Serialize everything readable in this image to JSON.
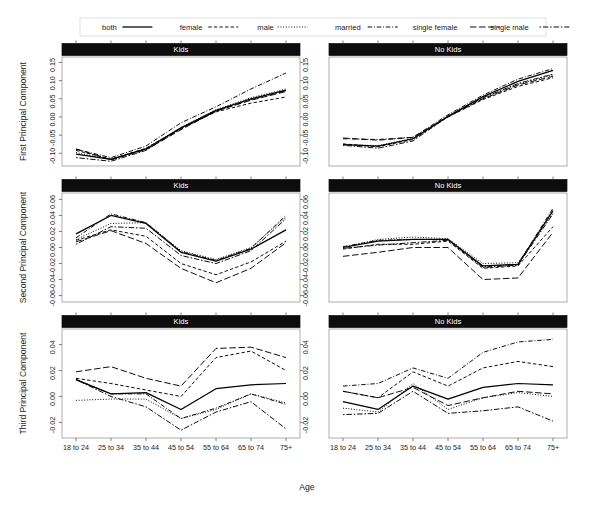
{
  "legend": {
    "position": "top",
    "entries": [
      {
        "label": "both",
        "dash": "none"
      },
      {
        "label": "female",
        "dash": "dashed"
      },
      {
        "label": "male",
        "dash": "dotted"
      },
      {
        "label": "married",
        "dash": "dashdot"
      },
      {
        "label": "single female",
        "dash": "longdash"
      },
      {
        "label": "single male",
        "dash": "twodash"
      }
    ]
  },
  "axes": {
    "xlabel": "Age",
    "categories": [
      "18 to 24",
      "25 to 34",
      "35 to 44",
      "45 to 54",
      "55 to 64",
      "65 to 74",
      "75+"
    ]
  },
  "strips": {
    "kids": "Kids",
    "nokids": "No Kids"
  },
  "rows": [
    {
      "ylabel": "First Principal Component",
      "yticks": [
        -0.1,
        -0.05,
        0.0,
        0.05,
        0.1,
        0.15
      ],
      "yticklabels": [
        "-0.10",
        "-0.05",
        "0.00",
        "0.05",
        "0.10",
        "0.15"
      ],
      "ylim": [
        -0.135,
        0.165
      ]
    },
    {
      "ylabel": "Second Principal Component",
      "yticks": [
        -0.06,
        -0.04,
        -0.02,
        0.0,
        0.02,
        0.04,
        0.06
      ],
      "yticklabels": [
        "-0.06",
        "-0.04",
        "-0.02",
        "0.00",
        "0.02",
        "0.04",
        "0.06"
      ],
      "ylim": [
        -0.068,
        0.068
      ]
    },
    {
      "ylabel": "Third Principal Component",
      "yticks": [
        -0.02,
        0.0,
        0.02,
        0.04
      ],
      "yticklabels": [
        "-0.02",
        "0.00",
        "0.02",
        "0.04"
      ],
      "ylim": [
        -0.032,
        0.052
      ]
    }
  ],
  "chart_data": {
    "type": "line",
    "title": "",
    "xlabel": "Age",
    "ylabel": "Principal Component Score",
    "grid": false,
    "legend_position": "top",
    "x": [
      "18 to 24",
      "25 to 34",
      "35 to 44",
      "45 to 54",
      "55 to 64",
      "65 to 74",
      "75+"
    ],
    "panels": [
      {
        "row": 1,
        "col": 1,
        "strip": "Kids",
        "ylabel": "First Principal Component",
        "ylim": [
          -0.135,
          0.165
        ],
        "yticks": [
          -0.1,
          -0.05,
          0.0,
          0.05,
          0.1,
          0.15
        ],
        "series": [
          {
            "name": "both",
            "dash": "none",
            "values": [
              -0.102,
              -0.117,
              -0.088,
              -0.03,
              0.018,
              0.05,
              0.074
            ]
          },
          {
            "name": "female",
            "dash": "dashed",
            "values": [
              -0.092,
              -0.116,
              -0.086,
              -0.031,
              0.014,
              0.038,
              0.055
            ]
          },
          {
            "name": "male",
            "dash": "dotted",
            "values": [
              -0.098,
              -0.117,
              -0.087,
              -0.029,
              0.02,
              0.053,
              0.077
            ]
          },
          {
            "name": "married",
            "dash": "dashdot",
            "values": [
              -0.089,
              -0.112,
              -0.08,
              -0.016,
              0.028,
              0.077,
              0.121
            ]
          },
          {
            "name": "single female",
            "dash": "longdash",
            "values": [
              -0.088,
              -0.118,
              -0.09,
              -0.035,
              0.016,
              0.046,
              0.07
            ]
          },
          {
            "name": "single male",
            "dash": "twodash",
            "values": [
              -0.112,
              -0.122,
              -0.092,
              -0.033,
              0.016,
              0.048,
              0.072
            ]
          }
        ]
      },
      {
        "row": 1,
        "col": 2,
        "strip": "No Kids",
        "ylabel": "First Principal Component",
        "ylim": [
          -0.135,
          0.165
        ],
        "yticks": [
          -0.1,
          -0.05,
          0.0,
          0.05,
          0.1,
          0.15
        ],
        "series": [
          {
            "name": "both",
            "dash": "none",
            "values": [
              -0.076,
              -0.08,
              -0.06,
              0.002,
              0.056,
              0.098,
              0.128
            ]
          },
          {
            "name": "female",
            "dash": "dashed",
            "values": [
              -0.074,
              -0.082,
              -0.062,
              0.0,
              0.048,
              0.084,
              0.108
            ]
          },
          {
            "name": "male",
            "dash": "dotted",
            "values": [
              -0.076,
              -0.079,
              -0.059,
              0.003,
              0.052,
              0.09,
              0.116
            ]
          },
          {
            "name": "married",
            "dash": "dashdot",
            "values": [
              -0.06,
              -0.062,
              -0.056,
              0.006,
              0.06,
              0.104,
              0.133
            ]
          },
          {
            "name": "single female",
            "dash": "longdash",
            "values": [
              -0.058,
              -0.064,
              -0.056,
              0.0,
              0.05,
              0.088,
              0.112
            ]
          },
          {
            "name": "single male",
            "dash": "twodash",
            "values": [
              -0.078,
              -0.086,
              -0.066,
              0.001,
              0.053,
              0.092,
              0.118
            ]
          }
        ]
      },
      {
        "row": 2,
        "col": 1,
        "strip": "Kids",
        "ylabel": "Second Principal Component",
        "ylim": [
          -0.068,
          0.068
        ],
        "yticks": [
          -0.06,
          -0.04,
          -0.02,
          0.0,
          0.02,
          0.04,
          0.06
        ],
        "series": [
          {
            "name": "both",
            "dash": "none",
            "values": [
              0.017,
              0.04,
              0.03,
              -0.006,
              -0.017,
              -0.002,
              0.022
            ]
          },
          {
            "name": "female",
            "dash": "dashed",
            "values": [
              0.009,
              0.022,
              0.014,
              -0.02,
              -0.034,
              -0.018,
              0.008
            ]
          },
          {
            "name": "male",
            "dash": "dotted",
            "values": [
              0.01,
              0.03,
              0.031,
              -0.004,
              -0.015,
              0.0,
              0.038
            ]
          },
          {
            "name": "married",
            "dash": "dashdot",
            "values": [
              0.012,
              0.042,
              0.031,
              -0.005,
              -0.016,
              -0.001,
              0.04
            ]
          },
          {
            "name": "single female",
            "dash": "longdash",
            "values": [
              0.007,
              0.021,
              0.005,
              -0.026,
              -0.044,
              -0.026,
              0.006
            ]
          },
          {
            "name": "single male",
            "dash": "twodash",
            "values": [
              0.004,
              0.026,
              0.024,
              -0.01,
              -0.02,
              -0.004,
              0.036
            ]
          }
        ]
      },
      {
        "row": 2,
        "col": 2,
        "strip": "No Kids",
        "ylabel": "Second Principal Component",
        "ylim": [
          -0.068,
          0.068
        ],
        "yticks": [
          -0.06,
          -0.04,
          -0.02,
          0.0,
          0.02,
          0.04,
          0.06
        ],
        "series": [
          {
            "name": "both",
            "dash": "none",
            "values": [
              0.0,
              0.008,
              0.01,
              0.01,
              -0.023,
              -0.021,
              0.046
            ]
          },
          {
            "name": "female",
            "dash": "dashed",
            "values": [
              -0.002,
              0.004,
              0.004,
              0.008,
              -0.026,
              -0.023,
              0.026
            ]
          },
          {
            "name": "male",
            "dash": "dotted",
            "values": [
              0.0,
              0.01,
              0.013,
              0.011,
              -0.02,
              -0.019,
              0.043
            ]
          },
          {
            "name": "married",
            "dash": "dashdot",
            "values": [
              0.001,
              0.009,
              0.01,
              0.01,
              -0.024,
              -0.021,
              0.049
            ]
          },
          {
            "name": "single female",
            "dash": "longdash",
            "values": [
              -0.011,
              -0.006,
              0.0,
              0.0,
              -0.04,
              -0.038,
              0.019
            ]
          },
          {
            "name": "single male",
            "dash": "twodash",
            "values": [
              -0.001,
              0.003,
              0.006,
              0.009,
              -0.025,
              -0.022,
              0.042
            ]
          }
        ]
      },
      {
        "row": 3,
        "col": 1,
        "strip": "Third Principal Component",
        "strip_label": "Kids",
        "ylabel": "Third Principal Component",
        "ylim": [
          -0.032,
          0.052
        ],
        "yticks": [
          -0.02,
          0.0,
          0.02,
          0.04
        ],
        "series": [
          {
            "name": "both",
            "dash": "none",
            "values": [
              0.013,
              0.002,
              0.003,
              -0.01,
              0.006,
              0.009,
              0.01
            ]
          },
          {
            "name": "female",
            "dash": "dashed",
            "values": [
              0.014,
              0.01,
              0.005,
              0.0,
              0.03,
              0.035,
              0.02
            ]
          },
          {
            "name": "male",
            "dash": "dotted",
            "values": [
              -0.003,
              -0.002,
              -0.002,
              -0.017,
              -0.01,
              0.002,
              -0.005
            ]
          },
          {
            "name": "married",
            "dash": "dashdot",
            "values": [
              0.013,
              0.002,
              0.002,
              -0.017,
              -0.009,
              0.002,
              -0.006
            ]
          },
          {
            "name": "single female",
            "dash": "longdash",
            "values": [
              0.019,
              0.023,
              0.014,
              0.008,
              0.037,
              0.038,
              0.03
            ]
          },
          {
            "name": "single male",
            "dash": "twodash",
            "values": [
              0.013,
              0.0,
              -0.008,
              -0.026,
              -0.012,
              -0.004,
              -0.025
            ]
          }
        ]
      },
      {
        "row": 3,
        "col": 2,
        "strip": "No Kids",
        "ylabel": "Third Principal Component",
        "ylim": [
          -0.032,
          0.052
        ],
        "yticks": [
          -0.02,
          0.0,
          0.02,
          0.04
        ],
        "series": [
          {
            "name": "both",
            "dash": "none",
            "values": [
              -0.004,
              -0.01,
              0.008,
              -0.002,
              0.007,
              0.01,
              0.009
            ]
          },
          {
            "name": "female",
            "dash": "dashed",
            "values": [
              0.004,
              -0.001,
              0.019,
              0.008,
              0.022,
              0.027,
              0.023
            ]
          },
          {
            "name": "male",
            "dash": "dotted",
            "values": [
              -0.009,
              -0.012,
              0.01,
              -0.01,
              -0.001,
              0.003,
              0.0
            ]
          },
          {
            "name": "married",
            "dash": "dashdot",
            "values": [
              0.008,
              0.01,
              0.022,
              0.014,
              0.034,
              0.042,
              0.044
            ]
          },
          {
            "name": "single female",
            "dash": "longdash",
            "values": [
              0.004,
              -0.001,
              0.007,
              -0.007,
              -0.001,
              0.004,
              0.002
            ]
          },
          {
            "name": "single male",
            "dash": "twodash",
            "values": [
              -0.014,
              -0.013,
              0.004,
              -0.013,
              -0.011,
              -0.008,
              -0.019
            ]
          }
        ]
      }
    ]
  }
}
